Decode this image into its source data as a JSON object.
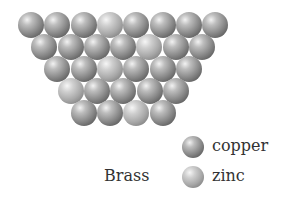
{
  "diagram": {
    "title": "Brass",
    "rows": [
      [
        "copper",
        "copper",
        "copper",
        "zinc",
        "copper",
        "copper",
        "copper",
        "copper"
      ],
      [
        "copper",
        "copper",
        "copper",
        "copper",
        "zinc",
        "copper",
        "copper"
      ],
      [
        "copper",
        "copper",
        "zinc",
        "copper",
        "copper",
        "copper"
      ],
      [
        "zinc",
        "copper",
        "copper",
        "copper",
        "copper"
      ],
      [
        "copper",
        "copper",
        "zinc",
        "copper"
      ]
    ],
    "legend": [
      {
        "key": "copper",
        "label": "copper"
      },
      {
        "key": "zinc",
        "label": "zinc"
      }
    ],
    "colors": {
      "copper": "#7a7a7a",
      "zinc": "#a8a8a8",
      "text": "#333333"
    }
  }
}
